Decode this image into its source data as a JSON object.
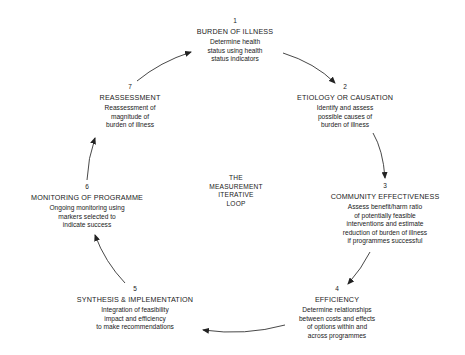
{
  "diagram": {
    "center_label": [
      "THE",
      "MEASUREMENT",
      "ITERATIVE",
      "LOOP"
    ],
    "nodes": [
      {
        "number": "1",
        "title": "BURDEN OF ILLNESS",
        "description": [
          "Determine health",
          "status using health",
          "status indicators"
        ]
      },
      {
        "number": "2",
        "title": "ETIOLOGY OR CAUSATION",
        "description": [
          "Identify and assess",
          "possible causes of",
          "burden of illness"
        ]
      },
      {
        "number": "3",
        "title": "COMMUNITY EFFECTIVENESS",
        "description": [
          "Assess benefit/harm ratio",
          "of potentially feasible",
          "interventions and estimate",
          "reduction of burden of illness",
          "if programmes successful"
        ]
      },
      {
        "number": "4",
        "title": "EFFICIENCY",
        "description": [
          "Determine relationships",
          "between costs and effects",
          "of options within and",
          "across programmes"
        ]
      },
      {
        "number": "5",
        "title": "SYNTHESIS & IMPLEMENTATION",
        "description": [
          "Integration of feasibility",
          "impact and efficiency",
          "to make recommendations"
        ]
      },
      {
        "number": "6",
        "title": "MONITORING OF PROGRAMME",
        "description": [
          "Ongoing monitoring using",
          "markers selected to",
          "indicate success"
        ]
      },
      {
        "number": "7",
        "title": "REASSESSMENT",
        "description": [
          "Reassessment of",
          "magnitude of",
          "burden of illness"
        ]
      }
    ],
    "arrows": [
      {
        "from": "1",
        "to": "2",
        "icon": "arrow-icon"
      },
      {
        "from": "2",
        "to": "3",
        "icon": "arrow-icon"
      },
      {
        "from": "3",
        "to": "4",
        "icon": "arrow-icon"
      },
      {
        "from": "4",
        "to": "5",
        "icon": "arrow-icon"
      },
      {
        "from": "5",
        "to": "6",
        "icon": "arrow-icon"
      },
      {
        "from": "6",
        "to": "7",
        "icon": "arrow-icon"
      },
      {
        "from": "7",
        "to": "1",
        "icon": "arrow-icon"
      }
    ],
    "colors": {
      "text": "#1a1a1a",
      "arrow": "#222222",
      "background": "#ffffff"
    }
  }
}
